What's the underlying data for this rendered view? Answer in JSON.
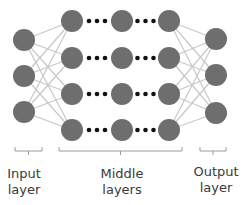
{
  "colors": {
    "node": "#6e6e6e",
    "edge": "#c8c8c8",
    "dots": "#111111",
    "bracket": "#9a9a9a",
    "text": "#3a3a3a"
  },
  "layers": {
    "input": {
      "x": 24,
      "ys": [
        40,
        76,
        112
      ]
    },
    "middle": {
      "xs": [
        72,
        122,
        169
      ],
      "ys": [
        21,
        58,
        94,
        130
      ]
    },
    "output": {
      "x": 216,
      "ys": [
        39,
        75,
        113
      ]
    }
  },
  "node_radius": 11,
  "labels": {
    "input": {
      "line1": "Input",
      "line2": "layer"
    },
    "middle": {
      "line1": "Middle",
      "line2": "layers"
    },
    "output": {
      "line1": "Output",
      "line2": "layer"
    }
  }
}
